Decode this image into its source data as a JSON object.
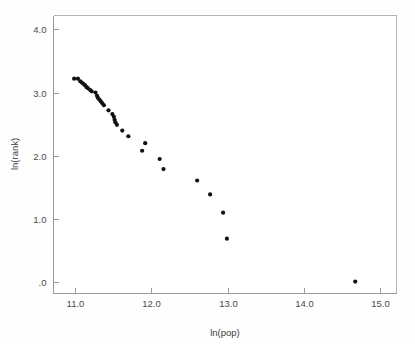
{
  "chart_data": {
    "type": "scatter",
    "title": "",
    "subtitle": "",
    "xlabel": "ln(pop)",
    "ylabel": "ln(rank)",
    "xlim": [
      10.72,
      15.21
    ],
    "ylim": [
      -0.17,
      4.22
    ],
    "xticks": [
      11.0,
      12.0,
      13.0,
      14.0,
      15.0
    ],
    "xticklabels": [
      "11.0",
      "12.0",
      "13.0",
      "14.0",
      "15.0"
    ],
    "yticks": [
      0.0,
      1.0,
      2.0,
      3.0,
      4.0
    ],
    "yticklabels": [
      ".0",
      "1.0",
      "2.0",
      "3.0",
      "4.0"
    ],
    "grid": false,
    "legend": null,
    "marker": {
      "shape": "circle",
      "color": "#111111",
      "size_px": 4.2
    },
    "series": [
      {
        "name": "cities",
        "points": [
          {
            "x": 10.99,
            "y": 3.22
          },
          {
            "x": 11.04,
            "y": 3.22
          },
          {
            "x": 11.07,
            "y": 3.18
          },
          {
            "x": 11.09,
            "y": 3.16
          },
          {
            "x": 11.11,
            "y": 3.14
          },
          {
            "x": 11.13,
            "y": 3.12
          },
          {
            "x": 11.15,
            "y": 3.09
          },
          {
            "x": 11.17,
            "y": 3.07
          },
          {
            "x": 11.2,
            "y": 3.04
          },
          {
            "x": 11.22,
            "y": 3.02
          },
          {
            "x": 11.27,
            "y": 3.0
          },
          {
            "x": 11.29,
            "y": 2.95
          },
          {
            "x": 11.3,
            "y": 2.92
          },
          {
            "x": 11.32,
            "y": 2.89
          },
          {
            "x": 11.34,
            "y": 2.86
          },
          {
            "x": 11.36,
            "y": 2.83
          },
          {
            "x": 11.38,
            "y": 2.8
          },
          {
            "x": 11.44,
            "y": 2.72
          },
          {
            "x": 11.49,
            "y": 2.66
          },
          {
            "x": 11.51,
            "y": 2.62
          },
          {
            "x": 11.52,
            "y": 2.57
          },
          {
            "x": 11.53,
            "y": 2.53
          },
          {
            "x": 11.55,
            "y": 2.49
          },
          {
            "x": 11.62,
            "y": 2.4
          },
          {
            "x": 11.7,
            "y": 2.31
          },
          {
            "x": 11.88,
            "y": 2.08
          },
          {
            "x": 11.92,
            "y": 2.2
          },
          {
            "x": 12.11,
            "y": 1.95
          },
          {
            "x": 12.16,
            "y": 1.79
          },
          {
            "x": 12.6,
            "y": 1.61
          },
          {
            "x": 12.77,
            "y": 1.39
          },
          {
            "x": 12.94,
            "y": 1.1
          },
          {
            "x": 12.99,
            "y": 0.69
          },
          {
            "x": 14.67,
            "y": 0.01
          }
        ]
      }
    ]
  },
  "figure": {
    "background": "#fefefe",
    "plot_background": "#ffffff",
    "frame_color": "#b5b5b5",
    "axis_color": "#9a9a9a",
    "text_color": "#4a4a4a"
  }
}
